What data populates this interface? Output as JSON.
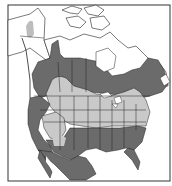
{
  "map": {
    "type": "species range map",
    "region": "North America",
    "colors": {
      "background": "#ffffff",
      "frame": "#333333",
      "outside_range_land": "#ffffff",
      "range_dark": "#6b6b6b",
      "range_light": "#c9c9c9",
      "range_pale_isolated": "#bdbdbd",
      "border_lines": "#222222"
    },
    "legend": {
      "dark_label": "Range zone (dark)",
      "light_label": "Range zone (light)"
    }
  }
}
